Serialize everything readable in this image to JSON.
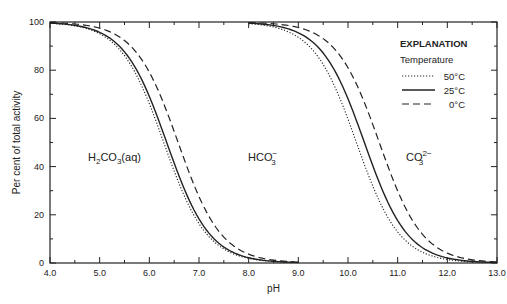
{
  "chart_data": {
    "type": "line",
    "title": "",
    "xlabel": "pH",
    "ylabel": "Per cent of total activity",
    "xlim": [
      4.0,
      13.0
    ],
    "ylim": [
      0,
      100
    ],
    "x_ticks": [
      "4.0",
      "5.0",
      "6.0",
      "7.0",
      "8.0",
      "9.0",
      "10.0",
      "11.0",
      "12.0",
      "13.0"
    ],
    "y_ticks": [
      "0",
      "20",
      "40",
      "60",
      "80",
      "100"
    ],
    "grid": false,
    "legend": {
      "title": "EXPLANATION",
      "subtitle": "Temperature",
      "position": "upper right",
      "entries": [
        {
          "label": "50°C",
          "style": "dotted"
        },
        {
          "label": "25°C",
          "style": "solid"
        },
        {
          "label": "0°C",
          "style": "dashed"
        }
      ]
    },
    "species_labels": [
      {
        "text": "H2CO3(aq)",
        "pH": 5.0,
        "percent": 42
      },
      {
        "text": "HCO3−",
        "pH": 9.0,
        "percent": 42
      },
      {
        "text": "CO3 2−",
        "pH": 11.7,
        "percent": 42
      }
    ],
    "series": [
      {
        "name": "50°C",
        "style": "dotted",
        "pKa1": 6.29,
        "pKa2": 10.17,
        "description": "Percent of total activity for H2CO3 + HCO3- (left curve) and H2CO3 + HCO3- boundary to CO3 (right curve)"
      },
      {
        "name": "25°C",
        "style": "solid",
        "pKa1": 6.35,
        "pKa2": 10.33
      },
      {
        "name": "0°C",
        "style": "dashed",
        "pKa1": 6.58,
        "pKa2": 10.63
      }
    ],
    "sample_points": {
      "x": [
        4.0,
        5.0,
        5.5,
        6.0,
        6.5,
        7.0,
        7.5,
        8.0,
        9.0
      ],
      "25C_left_curve": [
        99.6,
        95.7,
        87.6,
        69.1,
        41.5,
        18.3,
        6.6,
        2.2,
        0.2
      ],
      "x_right": [
        8.0,
        9.0,
        9.5,
        10.0,
        10.5,
        11.0,
        11.5,
        12.0,
        13.0
      ],
      "25C_right_curve": [
        99.5,
        95.5,
        87.1,
        68.1,
        40.3,
        17.6,
        6.3,
        2.1,
        0.2
      ]
    }
  },
  "labels": {
    "species1_main": "H",
    "species1_sub1": "2",
    "species1_mid": "CO",
    "species1_sub2": "3",
    "species1_end": "(aq)",
    "species2_main": "HCO",
    "species2_sub": "3",
    "species2_sup": "−",
    "species3_main": "CO",
    "species3_sub": "3",
    "species3_sup": "2−"
  }
}
